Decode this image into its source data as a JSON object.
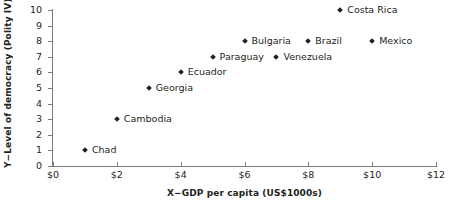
{
  "chart_data": {
    "type": "scatter",
    "title": "",
    "xlabel": "X−GDP per capita (US$1000s)",
    "ylabel": "Y−Level of democracy (Polity IV)",
    "xlim": [
      0,
      12
    ],
    "ylim": [
      0,
      10
    ],
    "xticks": [
      0,
      2,
      4,
      6,
      8,
      10,
      12
    ],
    "xtick_labels": [
      "$0",
      "$2",
      "$4",
      "$6",
      "$8",
      "$10",
      "$12"
    ],
    "yticks": [
      0,
      1,
      2,
      3,
      4,
      5,
      6,
      7,
      8,
      9,
      10
    ],
    "ytick_labels": [
      "0",
      "1",
      "2",
      "3",
      "4",
      "5",
      "6",
      "7",
      "8",
      "9",
      "10"
    ],
    "grid": false,
    "legend": "none",
    "marker": "diamond",
    "marker_color": "#231f20",
    "axis_color": "#7b7b7b",
    "points": [
      {
        "label": "Chad",
        "x": 1,
        "y": 1
      },
      {
        "label": "Cambodia",
        "x": 2,
        "y": 3
      },
      {
        "label": "Georgia",
        "x": 3,
        "y": 5
      },
      {
        "label": "Ecuador",
        "x": 4,
        "y": 6
      },
      {
        "label": "Paraguay",
        "x": 5,
        "y": 7
      },
      {
        "label": "Bulgaria",
        "x": 6,
        "y": 8
      },
      {
        "label": "Venezuela",
        "x": 7,
        "y": 7
      },
      {
        "label": "Brazil",
        "x": 8,
        "y": 8
      },
      {
        "label": "Costa Rica",
        "x": 9,
        "y": 10
      },
      {
        "label": "Mexico",
        "x": 10,
        "y": 8
      }
    ]
  }
}
